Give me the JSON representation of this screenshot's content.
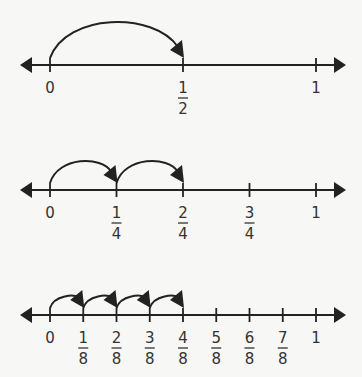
{
  "diagram": {
    "title": "",
    "colors": {
      "line": "#222222",
      "text": "#333333",
      "background": "#f7f7f5"
    },
    "number_lines": [
      {
        "name": "halves",
        "axis_y": 65,
        "ticks": [
          {
            "num": "0",
            "den": ""
          },
          {
            "num": "1",
            "den": "2"
          },
          {
            "num": "1",
            "den": ""
          }
        ],
        "jumps": [
          [
            0,
            1
          ]
        ]
      },
      {
        "name": "fourths",
        "axis_y": 190,
        "ticks": [
          {
            "num": "0",
            "den": ""
          },
          {
            "num": "1",
            "den": "4"
          },
          {
            "num": "2",
            "den": "4"
          },
          {
            "num": "3",
            "den": "4"
          },
          {
            "num": "1",
            "den": ""
          }
        ],
        "jumps": [
          [
            0,
            1
          ],
          [
            1,
            2
          ]
        ]
      },
      {
        "name": "eighths",
        "axis_y": 315,
        "ticks": [
          {
            "num": "0",
            "den": ""
          },
          {
            "num": "1",
            "den": "8"
          },
          {
            "num": "2",
            "den": "8"
          },
          {
            "num": "3",
            "den": "8"
          },
          {
            "num": "4",
            "den": "8"
          },
          {
            "num": "5",
            "den": "8"
          },
          {
            "num": "6",
            "den": "8"
          },
          {
            "num": "7",
            "den": "8"
          },
          {
            "num": "1",
            "den": ""
          }
        ],
        "jumps": [
          [
            0,
            1
          ],
          [
            1,
            2
          ],
          [
            2,
            3
          ],
          [
            3,
            4
          ]
        ]
      }
    ]
  }
}
